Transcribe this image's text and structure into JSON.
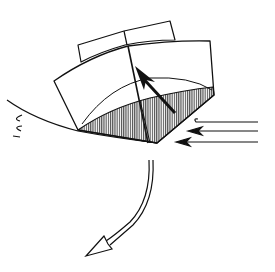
{
  "diagram": {
    "description": "Line illustration of a boat-like block hull heeling on a wave; hatched bottom, internal force arrow, incoming water arrows from right, curved downward arrow",
    "colors": {
      "stroke": "#111111",
      "background": "#ffffff",
      "hatch": "#222222"
    },
    "elements": [
      {
        "name": "cabin-block",
        "kind": "shape"
      },
      {
        "name": "hull-body",
        "kind": "shape"
      },
      {
        "name": "hatched-bottom",
        "kind": "shaded-region"
      },
      {
        "name": "wave-line",
        "kind": "curve"
      },
      {
        "name": "splash-marks",
        "kind": "marks"
      },
      {
        "name": "internal-force-arrow",
        "kind": "arrow"
      },
      {
        "name": "water-flow-arrows",
        "kind": "arrow",
        "count": 3
      },
      {
        "name": "capsize-rotation-arrow",
        "kind": "arrow"
      }
    ]
  }
}
